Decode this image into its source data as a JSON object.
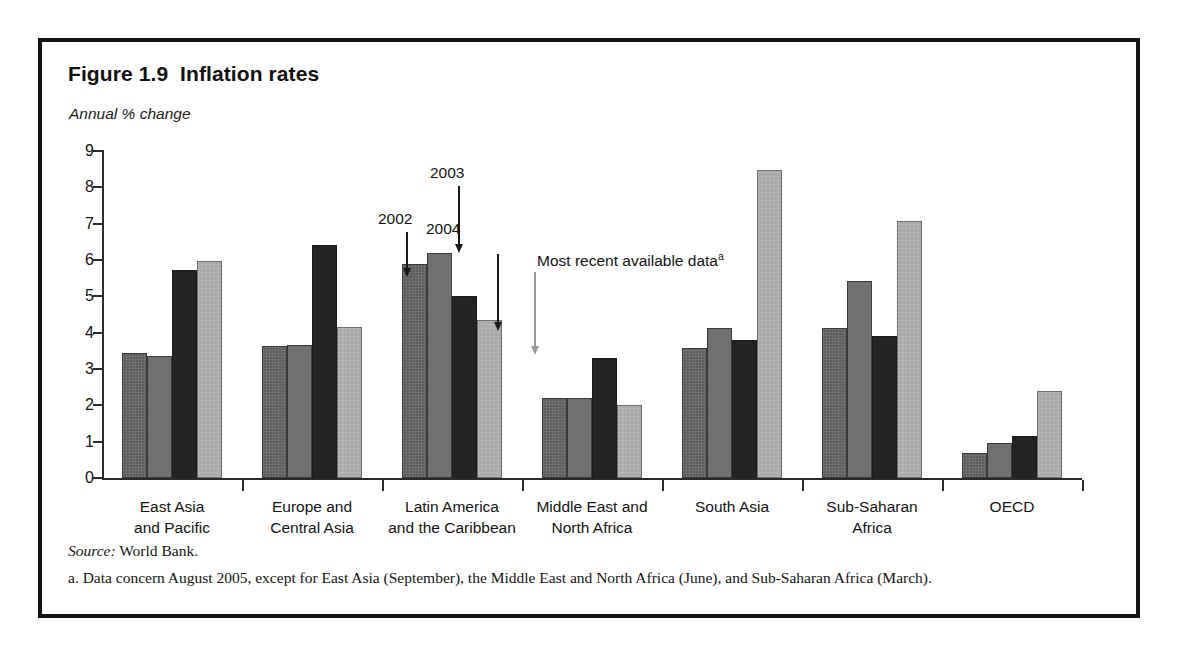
{
  "figure": {
    "title": "Figure 1.9  Inflation rates",
    "axis_unit_label": "Annual % change",
    "source": {
      "label": "Source:",
      "text": " World Bank."
    },
    "footnote": "a. Data concern August 2005, except for East Asia (September), the Middle East and North Africa (June), and Sub-Saharan Africa (March)."
  },
  "annotations": {
    "a2002": "2002",
    "a2003": "2003",
    "a2004": "2004",
    "most_recent": "Most recent available data",
    "most_recent_sup": "a"
  },
  "colors": {
    "series_2002": "#5d5d5d",
    "series_2003": "#707070",
    "series_2004": "#242424",
    "series_most_recent": "#a9a9a9",
    "axis": "#2a2a2a",
    "frame": "#131313"
  },
  "chart_data": {
    "type": "bar",
    "title": "Figure 1.9  Inflation rates",
    "xlabel": "",
    "ylabel": "Annual % change",
    "ylim": [
      0,
      9
    ],
    "yticks": [
      0,
      1,
      2,
      3,
      4,
      5,
      6,
      7,
      8,
      9
    ],
    "grid": false,
    "legend_position": "annotated-arrows",
    "categories": [
      "East Asia and Pacific",
      "Europe and Central Asia",
      "Latin America and the Caribbean",
      "Middle East and North Africa",
      "South Asia",
      "Sub-Saharan Africa",
      "OECD"
    ],
    "category_lines": [
      [
        "East Asia",
        "and Pacific"
      ],
      [
        "Europe and",
        "Central Asia"
      ],
      [
        "Latin America",
        "and the Caribbean"
      ],
      [
        "Middle East and",
        "North Africa"
      ],
      [
        "South Asia",
        ""
      ],
      [
        "Sub-Saharan",
        "Africa"
      ],
      [
        "OECD",
        ""
      ]
    ],
    "series": [
      {
        "name": "2002",
        "values": [
          3.45,
          3.62,
          5.88,
          2.2,
          3.58,
          4.13,
          0.7
        ]
      },
      {
        "name": "2003",
        "values": [
          3.35,
          3.67,
          6.2,
          2.2,
          4.13,
          5.42,
          0.95
        ]
      },
      {
        "name": "2004",
        "values": [
          5.72,
          6.4,
          5.0,
          3.3,
          3.8,
          3.9,
          1.15
        ]
      },
      {
        "name": "Most recent available data",
        "values": [
          5.98,
          4.17,
          4.35,
          2.0,
          8.47,
          7.08,
          2.4
        ]
      }
    ]
  }
}
